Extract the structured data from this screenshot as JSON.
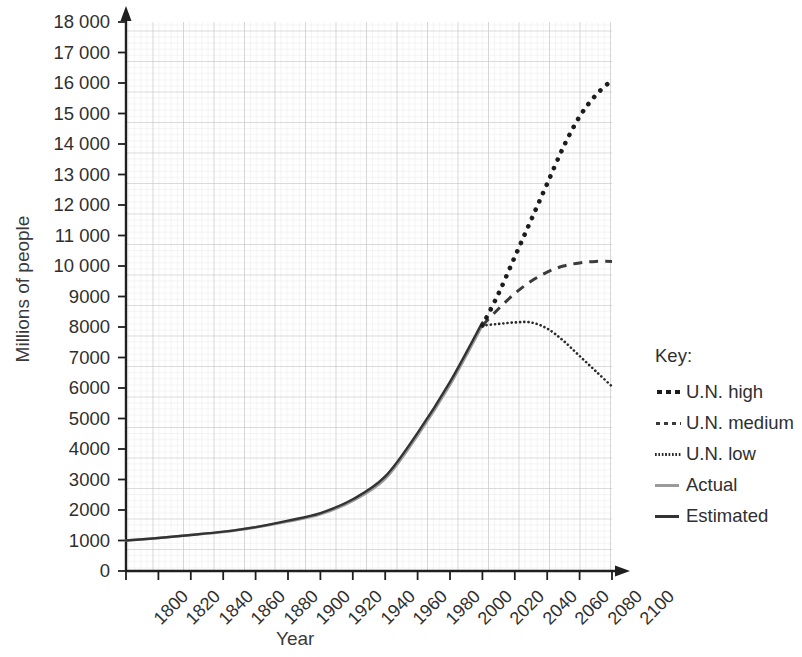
{
  "chart_data": {
    "type": "line",
    "title": "",
    "xlabel": "Year",
    "ylabel": "Millions of people",
    "xlim": [
      1800,
      2100
    ],
    "ylim": [
      0,
      18000
    ],
    "grid": true,
    "legend_position": "right",
    "legend_title": "Key:",
    "xticks": [
      1800,
      1820,
      1840,
      1860,
      1880,
      1900,
      1920,
      1940,
      1960,
      1980,
      2000,
      2020,
      2040,
      2060,
      2080,
      2100
    ],
    "yticks": [
      0,
      1000,
      2000,
      3000,
      4000,
      5000,
      6000,
      7000,
      8000,
      9000,
      10000,
      11000,
      12000,
      13000,
      14000,
      15000,
      16000,
      17000,
      18000
    ],
    "ytick_labels": [
      "0",
      "1000",
      "2000",
      "3000",
      "4000",
      "5000",
      "6000",
      "7000",
      "8000",
      "9000",
      "10 000",
      "11 000",
      "12 000",
      "13 000",
      "14 000",
      "15 000",
      "16 000",
      "17 000",
      "18 000"
    ],
    "series": [
      {
        "name": "U.N. high",
        "style": "dotted-thick",
        "color": "#1c1c1c",
        "x": [
          2020,
          2030,
          2040,
          2050,
          2060,
          2070,
          2080,
          2090,
          2100
        ],
        "values": [
          8050,
          9100,
          10300,
          11500,
          12700,
          13900,
          14900,
          15600,
          16100
        ]
      },
      {
        "name": "U.N. medium",
        "style": "dashed",
        "color": "#3b3b3b",
        "x": [
          2020,
          2030,
          2040,
          2050,
          2060,
          2070,
          2080,
          2090,
          2100
        ],
        "values": [
          8050,
          8600,
          9100,
          9500,
          9800,
          10000,
          10100,
          10150,
          10150
        ]
      },
      {
        "name": "U.N. low",
        "style": "dotted-fine",
        "color": "#2a2a2a",
        "x": [
          2020,
          2030,
          2040,
          2050,
          2060,
          2070,
          2080,
          2090,
          2100
        ],
        "values": [
          8050,
          8100,
          8150,
          8150,
          7950,
          7550,
          7050,
          6550,
          6050
        ]
      },
      {
        "name": "Actual",
        "style": "solid-light",
        "color": "#9a9a9a",
        "x": [
          1800,
          1820,
          1840,
          1860,
          1880,
          1900,
          1920,
          1940,
          1960,
          1980,
          2000,
          2020
        ],
        "values": [
          1000,
          1080,
          1180,
          1280,
          1430,
          1620,
          1860,
          2300,
          3020,
          4440,
          6100,
          8050
        ]
      },
      {
        "name": "Estimated",
        "style": "solid-dark",
        "color": "#333333",
        "x": [
          1800,
          1820,
          1840,
          1860,
          1880,
          1900,
          1920,
          1940,
          1960,
          1980,
          2000,
          2020
        ],
        "values": [
          1000,
          1080,
          1180,
          1290,
          1440,
          1650,
          1900,
          2350,
          3100,
          4530,
          6200,
          8150
        ]
      }
    ]
  },
  "axes": {
    "ylabel": "Millions of people",
    "xlabel": "Year"
  },
  "legend": {
    "title": "Key:",
    "items": [
      {
        "label": "U.N. high"
      },
      {
        "label": "U.N. medium"
      },
      {
        "label": "U.N. low"
      },
      {
        "label": "Actual"
      },
      {
        "label": "Estimated"
      }
    ]
  }
}
